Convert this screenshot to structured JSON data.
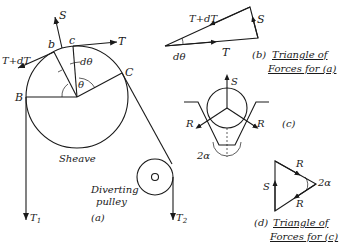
{
  "figure_a": {
    "S": "S",
    "b": "b",
    "c": "c",
    "T": "T",
    "TdT": "T+dT",
    "dtheta": "dθ",
    "theta": "θ",
    "B": "B",
    "C": "C",
    "sheave": "Sheave",
    "diverting_1": "Diverting",
    "diverting_2": "pulley",
    "T1": "T",
    "T1_sub": "1",
    "T2": "T",
    "T2_sub": "2",
    "caption": "(a)"
  },
  "figure_b": {
    "TdT": "T+dT",
    "S": "S",
    "T": "T",
    "dtheta": "dθ",
    "caption_prefix": "(b)",
    "caption_1": "Triangle of",
    "caption_2": "Forces for (a)"
  },
  "figure_c": {
    "S": "S",
    "R_left": "R",
    "R_right": "R",
    "alpha": "2α",
    "caption": "(c)"
  },
  "figure_d": {
    "R_top": "R",
    "R_bottom": "R",
    "S": "S",
    "alpha": "2α",
    "caption_prefix": "(d)",
    "caption_1": "Triangle of",
    "caption_2": "Forces for (c)"
  }
}
